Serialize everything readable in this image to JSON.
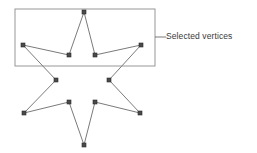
{
  "diagram": {
    "type": "vertex-selection-illustration",
    "canvas": {
      "width": 257,
      "height": 153
    },
    "colors": {
      "background": "#ffffff",
      "outline": "#6b6b6b",
      "vertex_fill": "#4a4a4a",
      "vertex_stroke": "#2b2b2b",
      "marquee_stroke": "#8c8c8c",
      "leader_line": "#6b6b6b",
      "label_text": "#3a3a3a"
    },
    "star": {
      "points": 6,
      "outline_width": 0.9,
      "path": "84,12 95,55 141,45 109,80 140,113 95,102 84,145 69,102 24,113 56,80 23,45 69,55",
      "vertices": [
        {
          "id": "top-point",
          "x": 84,
          "y": 12,
          "selected": true
        },
        {
          "id": "upper-right-inner",
          "x": 95,
          "y": 55,
          "selected": true
        },
        {
          "id": "right-point",
          "x": 141,
          "y": 45,
          "selected": true
        },
        {
          "id": "middle-right-inner",
          "x": 109,
          "y": 80,
          "selected": false
        },
        {
          "id": "lower-right-point",
          "x": 140,
          "y": 113,
          "selected": false
        },
        {
          "id": "lower-right-inner",
          "x": 95,
          "y": 102,
          "selected": false
        },
        {
          "id": "bottom-point",
          "x": 84,
          "y": 145,
          "selected": false
        },
        {
          "id": "lower-left-inner",
          "x": 69,
          "y": 102,
          "selected": false
        },
        {
          "id": "lower-left-point",
          "x": 24,
          "y": 113,
          "selected": false
        },
        {
          "id": "middle-left-inner",
          "x": 56,
          "y": 80,
          "selected": false
        },
        {
          "id": "left-point",
          "x": 23,
          "y": 45,
          "selected": true
        },
        {
          "id": "upper-left-inner",
          "x": 69,
          "y": 55,
          "selected": true
        }
      ],
      "vertex_marker": {
        "shape": "square",
        "size": 4
      }
    },
    "selection_marquee": {
      "x": 15,
      "y": 9,
      "width": 140,
      "height": 57,
      "stroke_width": 0.9,
      "enclosed_vertex_count": 5
    },
    "callout": {
      "label": "Selected vertices",
      "leader_line": {
        "x1": 155,
        "y1": 37,
        "x2": 166,
        "y2": 37
      },
      "text_x": 166,
      "text_y": 37
    }
  }
}
